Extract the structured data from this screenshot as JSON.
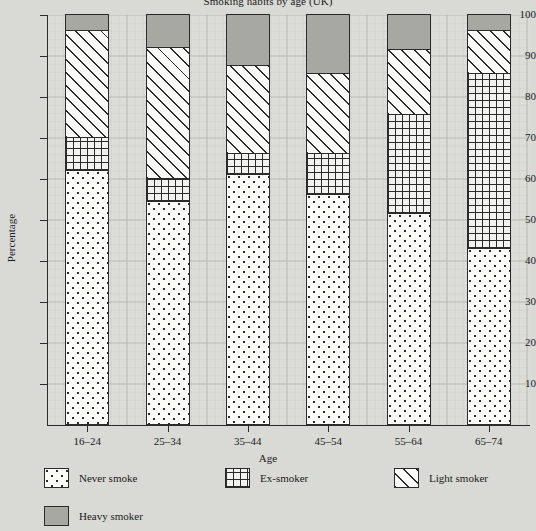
{
  "chart_data": {
    "type": "bar",
    "subtype": "stacked-bar-percent",
    "title": "Smoking habits by age (UK)",
    "xlabel": "Age",
    "ylabel": "Percentage",
    "categories": [
      "16–24",
      "25–34",
      "35–44",
      "45–54",
      "55–64",
      "65–74"
    ],
    "series": [
      {
        "name": "Never smoke",
        "pattern": "dots",
        "values": [
          62.0,
          54.5,
          61.0,
          56.0,
          51.5,
          43.0
        ]
      },
      {
        "name": "Ex-smoker",
        "pattern": "cross-hatch",
        "values": [
          8.0,
          5.5,
          5.0,
          10.0,
          24.0,
          42.5
        ]
      },
      {
        "name": "Light smoker",
        "pattern": "diagonal",
        "values": [
          26.0,
          32.0,
          21.5,
          19.5,
          16.0,
          10.5
        ]
      },
      {
        "name": "Heavy smoker",
        "pattern": "solid-grey",
        "values": [
          4.0,
          8.0,
          12.5,
          14.5,
          8.5,
          4.0
        ]
      }
    ],
    "cumulative_tops": [
      [
        62.0,
        70.0,
        96.0,
        100
      ],
      [
        54.5,
        60.0,
        92.0,
        100
      ],
      [
        61.0,
        66.0,
        87.5,
        100
      ],
      [
        56.0,
        66.0,
        85.5,
        100
      ],
      [
        51.5,
        75.5,
        91.5,
        100
      ],
      [
        43.0,
        85.5,
        96.0,
        100
      ]
    ],
    "ylim": [
      0,
      100
    ],
    "yticks": [
      10,
      20,
      30,
      40,
      50,
      60,
      70,
      80,
      90,
      100
    ],
    "ytick_labels": [
      "10",
      "20",
      "30",
      "40",
      "50",
      "60",
      "70",
      "80",
      "90",
      "100"
    ],
    "grid": true,
    "legend_position": "bottom"
  },
  "legend": {
    "items": [
      {
        "label": "Never smoke",
        "swatch": "dots-swatch"
      },
      {
        "label": "Ex-smoker",
        "swatch": "cross-hatch-swatch"
      },
      {
        "label": "Light smoker",
        "swatch": "diagonal-hatch-swatch"
      },
      {
        "label": "Heavy smoker",
        "swatch": "solid-grey-swatch"
      }
    ]
  },
  "colors": {
    "background": "#d9d9d6",
    "plot_background": "#dcdcd8",
    "ink": "#2b2b2b",
    "heavy_smoker_fill": "#a8a8a3",
    "light_fill": "#fbfbf8"
  }
}
